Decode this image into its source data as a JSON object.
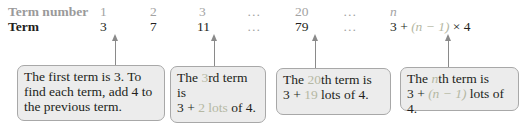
{
  "table": {
    "row_labels": {
      "term_number": "Term number",
      "term": "Term"
    },
    "term_numbers": [
      "1",
      "2",
      "3",
      "…",
      "20",
      "…",
      "n"
    ],
    "terms": [
      "3",
      "7",
      "11",
      "…",
      "79",
      "…"
    ],
    "general_term": {
      "prefix": "3 + ",
      "paren": "(n − 1)",
      "suffix": " × 4"
    }
  },
  "callouts": [
    {
      "text": "The first term is 3. To find each term, add 4 to the previous term."
    },
    {
      "line1_pre": "The ",
      "line1_hl": "3",
      "line1_post": "rd term is",
      "line2_pre": "3 + ",
      "line2_hl": "2 lots",
      "line2_post": " of 4."
    },
    {
      "line1_pre": "The ",
      "line1_hl": "20",
      "line1_post": "th term is",
      "line2_pre": "3 + ",
      "line2_hl": "19",
      "line2_post": " lots of 4."
    },
    {
      "line1_pre": "The ",
      "line1_hl": "n",
      "line1_post": "th term is",
      "line2_pre": "3 + ",
      "line2_hl": "(n − 1)",
      "line2_post": " lots of 4."
    }
  ],
  "colors": {
    "highlight": "#b5b8a3",
    "label_grey": "#9a9a9a",
    "box_fill": "#ececec",
    "box_border": "#a8a8a8"
  }
}
